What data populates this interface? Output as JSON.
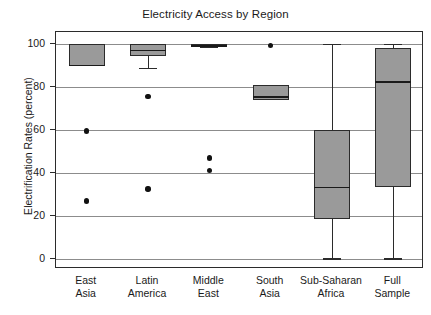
{
  "chart_data": {
    "type": "box",
    "title": "Electricity Access by Region",
    "xlabel": "",
    "ylabel": "Electrification Rates (percent)",
    "ylim": [
      0,
      100
    ],
    "yticks": [
      0,
      20,
      40,
      60,
      80,
      100
    ],
    "ytick_labels": [
      "0",
      "20",
      "40",
      "60",
      "80",
      "100"
    ],
    "grid": true,
    "legend": "none",
    "categories": [
      "East Asia",
      "Latin America",
      "Middle East",
      "South Asia",
      "Sub-Saharan Africa",
      "Full Sample"
    ],
    "category_lines": [
      [
        "East",
        "Asia"
      ],
      [
        "Latin",
        "America"
      ],
      [
        "Middle",
        "East"
      ],
      [
        "South",
        "Asia"
      ],
      [
        "Sub-Saharan",
        "Africa"
      ],
      [
        "Full",
        "Sample"
      ]
    ],
    "boxes": [
      {
        "category": "East Asia",
        "whisker_low": 90.0,
        "q1": 90.0,
        "median": 90.0,
        "q3": 100.0,
        "whisker_high": 100.0,
        "outliers": [
          59.5,
          27.0
        ]
      },
      {
        "category": "Latin America",
        "whisker_low": 89.0,
        "q1": 94.5,
        "median": 97.0,
        "q3": 100.0,
        "whisker_high": 100.0,
        "outliers": [
          75.5,
          32.5
        ]
      },
      {
        "category": "Middle East",
        "whisker_low": 98.5,
        "q1": 98.7,
        "median": 99.2,
        "q3": 99.8,
        "whisker_high": 99.8,
        "outliers": [
          47.0,
          41.3
        ]
      },
      {
        "category": "South Asia",
        "whisker_low": 74.0,
        "q1": 74.0,
        "median": 75.5,
        "q3": 81.0,
        "whisker_high": 81.0,
        "outliers": [
          99.2
        ]
      },
      {
        "category": "Sub-Saharan Africa",
        "whisker_low": 0.3,
        "q1": 18.5,
        "median": 33.3,
        "q3": 60.2,
        "whisker_high": 100.0,
        "outliers": []
      },
      {
        "category": "Full Sample",
        "whisker_low": 0.3,
        "q1": 33.3,
        "median": 82.5,
        "q3": 98.0,
        "whisker_high": 100.0,
        "outliers": []
      }
    ],
    "colors": {
      "box_fill": "#9a9a9a",
      "box_edge": "#2b2b2b",
      "median": "#1a1a1a",
      "outlier": "#111111",
      "gridline": "#8c8c8c",
      "frame": "#2b2b2b",
      "background": "#ffffff",
      "text": "#1a1a1a"
    }
  }
}
